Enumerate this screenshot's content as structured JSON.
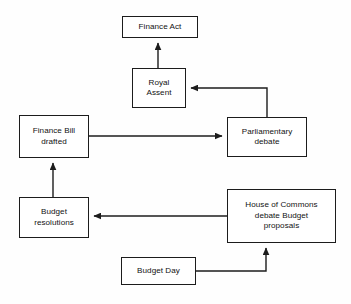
{
  "diagram": {
    "background_color": "#fefefe",
    "line_color": "#1c1c1c",
    "text_color": "#121212",
    "nodes": [
      {
        "id": "finance-act",
        "label": "Finance Act",
        "x": 122,
        "y": 16,
        "w": 76,
        "h": 22
      },
      {
        "id": "royal-assent",
        "label": "Royal\nAssent",
        "x": 132,
        "y": 68,
        "w": 54,
        "h": 40
      },
      {
        "id": "finance-bill-drafted",
        "label": "Finance Bill\ndrafted",
        "x": 19,
        "y": 115,
        "w": 70,
        "h": 43
      },
      {
        "id": "parliamentary-debate",
        "label": "Parliamentary\ndebate",
        "x": 227,
        "y": 117,
        "w": 80,
        "h": 40
      },
      {
        "id": "budget-resolutions",
        "label": "Budget\nresolutions",
        "x": 19,
        "y": 197,
        "w": 70,
        "h": 41
      },
      {
        "id": "house-of-commons",
        "label": "House of Commons\ndebate Budget\nproposals",
        "x": 227,
        "y": 189,
        "w": 109,
        "h": 54
      },
      {
        "id": "budget-day",
        "label": "Budget Day",
        "x": 121,
        "y": 257,
        "w": 75,
        "h": 28
      }
    ],
    "edges": [
      {
        "id": "budget-day-to-house-of-commons",
        "from": "budget-day",
        "to": "house-of-commons",
        "points": "196,271 266,271 266,247",
        "arrow": "up"
      },
      {
        "id": "house-of-commons-to-budget-resolutions",
        "from": "house-of-commons",
        "to": "budget-resolutions",
        "points": "227,216 93,216",
        "arrow": "left"
      },
      {
        "id": "budget-resolutions-to-finance-bill",
        "from": "budget-resolutions",
        "to": "finance-bill-drafted",
        "points": "53,197 53,162",
        "arrow": "up"
      },
      {
        "id": "finance-bill-to-parliamentary-debate",
        "from": "finance-bill-drafted",
        "to": "parliamentary-debate",
        "points": "89,136 223,136",
        "arrow": "right"
      },
      {
        "id": "parliamentary-debate-to-royal-assent",
        "from": "parliamentary-debate",
        "to": "royal-assent",
        "points": "267,117 267,88 190,88",
        "arrow": "left"
      },
      {
        "id": "royal-assent-to-finance-act",
        "from": "royal-assent",
        "to": "finance-act",
        "points": "158,68 158,42",
        "arrow": "up"
      }
    ]
  }
}
